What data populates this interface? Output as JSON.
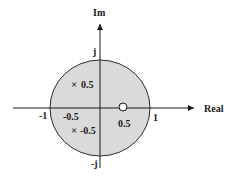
{
  "diagram": {
    "type": "pole-zero plot",
    "axes": {
      "x_label": "Real",
      "y_label": "Im",
      "x_ticks": [
        "-1",
        "1"
      ],
      "y_ticks": [
        "j",
        "-j"
      ]
    },
    "region": {
      "description": "unit circle region (shaded)",
      "fill": "#dadada"
    },
    "poles": [
      {
        "label": "0.5",
        "marker": "×",
        "re": 0,
        "im": 0.5
      },
      {
        "label": "-0.5",
        "marker": "×",
        "re": 0,
        "im": -0.5
      }
    ],
    "zeros": [
      {
        "label": "0.5",
        "marker": "○",
        "re": 0.5,
        "im": 0
      }
    ],
    "annotations": {
      "neg_half_real": "-0.5"
    }
  }
}
